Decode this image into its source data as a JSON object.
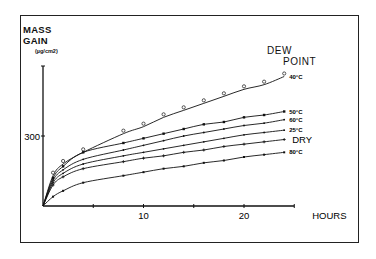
{
  "chart_data": {
    "type": "line",
    "title": "",
    "xlabel": "HOURS",
    "ylabel": "MASS GAIN",
    "yunit": "(µg/cm2)",
    "legend_title": [
      "DEW",
      "POINT"
    ],
    "xlim": [
      0,
      25
    ],
    "ylim": [
      0,
      600
    ],
    "x_ticks": [
      0,
      5,
      10,
      15,
      20,
      25
    ],
    "x_tick_labels": [
      "",
      "",
      "10",
      "",
      "20",
      ""
    ],
    "y_ticks": [
      300
    ],
    "y_tick_labels": [
      "300"
    ],
    "grid": false,
    "legend_position": "inline-right",
    "x": [
      0,
      1,
      2,
      4,
      8,
      10,
      12,
      14,
      16,
      18,
      20,
      22,
      24
    ],
    "series": [
      {
        "name": "40°C",
        "marker": "circle",
        "values": [
          0,
          130,
          180,
          230,
          310,
          340,
          380,
          410,
          440,
          470,
          500,
          520,
          555
        ]
      },
      {
        "name": "50°C",
        "marker": "square",
        "values": [
          0,
          120,
          170,
          230,
          270,
          290,
          310,
          330,
          350,
          360,
          380,
          390,
          405
        ]
      },
      {
        "name": "60°C",
        "marker": "dot",
        "values": [
          0,
          110,
          155,
          200,
          240,
          260,
          280,
          300,
          315,
          330,
          345,
          355,
          370
        ]
      },
      {
        "name": "25°C",
        "marker": "dash",
        "values": [
          0,
          100,
          140,
          180,
          215,
          230,
          245,
          260,
          275,
          290,
          305,
          315,
          325
        ]
      },
      {
        "name": "DRY",
        "marker": "plus",
        "values": [
          0,
          90,
          125,
          160,
          190,
          205,
          215,
          230,
          240,
          255,
          265,
          275,
          285
        ]
      },
      {
        "name": "80°C",
        "marker": "x",
        "values": [
          0,
          40,
          65,
          100,
          130,
          145,
          160,
          170,
          185,
          195,
          210,
          220,
          230
        ]
      }
    ]
  }
}
